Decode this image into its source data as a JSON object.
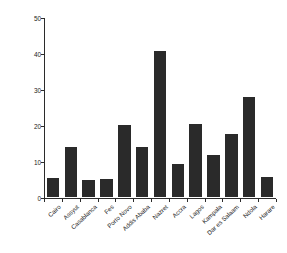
{
  "chart_data": {
    "type": "bar",
    "title": "",
    "subtitle": "",
    "xlabel": "",
    "ylabel": "Percentage of children with ARI (%)",
    "categories": [
      "Cairo",
      "Assyut",
      "Casablanca",
      "Fes",
      "Porto Novo",
      "Addis Ababa",
      "Nazret",
      "Accra",
      "Lagos",
      "Kampala",
      "Dar es Salaam",
      "Ndola",
      "Harare"
    ],
    "values": [
      5.4,
      13.8,
      4.8,
      5.0,
      20.0,
      14.0,
      40.5,
      9.3,
      20.2,
      11.7,
      17.5,
      27.7,
      5.6
    ],
    "ylim": [
      0,
      50
    ],
    "yticks": [
      0,
      10,
      20,
      30,
      40,
      50
    ],
    "ytick_labels": [
      "0",
      "10",
      "20",
      "30",
      "40",
      "50"
    ],
    "grid": false,
    "legend": null,
    "legend_position": "none",
    "bar_color": "#2a2a2a",
    "axis_color": "#2b2b2b",
    "background_color": "#ffffff"
  }
}
